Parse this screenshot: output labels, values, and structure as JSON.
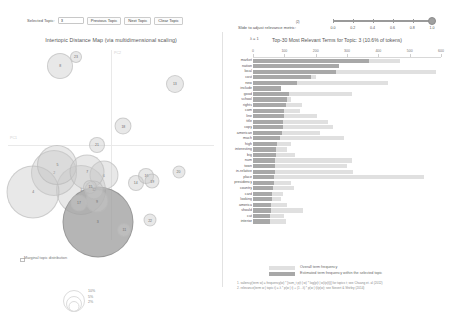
{
  "controls": {
    "selected_topic_label": "Selected Topic:",
    "selected_topic_value": "3",
    "previous_topic_label": "Previous Topic",
    "next_topic_label": "Next Topic",
    "clear_topic_label": "Clear Topic",
    "slider_label": "Slide to adjust relevance metric:",
    "slider_superscript": "(2)",
    "lambda_equation": "λ = 1",
    "slider_value": 1.0,
    "slider_ticks": [
      "0.0",
      "0.2",
      "0.4",
      "0.6",
      "0.8",
      "1.0"
    ]
  },
  "left_panel": {
    "title": "Intertopic Distance Map (via multidimensional scaling)",
    "axis_x_label": "PC2",
    "axis_y_label": "PC1",
    "marginal_label": "Marginal topic distribution",
    "size_keys": [
      "2%",
      "5%",
      "10%"
    ]
  },
  "right_panel": {
    "title": "Top-30 Most Relevant Terms for Topic: 3 (10.6% of tokens)",
    "axis_ticks": [
      "0",
      "100",
      "200",
      "300",
      "400",
      "500",
      "600"
    ],
    "axis_max": 600,
    "legend": {
      "overall_label": "Overall term frequency",
      "selected_label": "Estimated term frequency within the selected topic"
    },
    "footnotes": [
      "1. saliency(term w) = frequency(w) * [sum_t p(t | w) * log(p(t | w)/p(t))] for topics t; see Chuang et. al (2012)",
      "2. relevance(term w | topic t) = λ * p(w | t) + (1 - λ) * p(w | t)/p(w); see Sievert & Shirley (2014)"
    ]
  },
  "chart_data": {
    "type": "bar",
    "title": "Top-30 Most Relevant Terms for Topic: 3 (10.6% of tokens)",
    "xlabel": "",
    "ylabel": "",
    "xlim": [
      0,
      600
    ],
    "grid": false,
    "legend_position": "bottom",
    "orientation": "horizontal",
    "categories": [
      "market",
      "nation",
      "local",
      "cost",
      "new",
      "include",
      "good",
      "school",
      "rights",
      "com",
      "line",
      "title",
      "copy",
      "american",
      "much",
      "high",
      "interesting",
      "big",
      "num",
      "town",
      "in-relative",
      "place",
      "presidency",
      "country",
      "card",
      "looking",
      "america",
      "should",
      "cut",
      "interior"
    ],
    "series": [
      {
        "name": "Overall term frequency",
        "values": [
          470,
          235,
          585,
          200,
          430,
          90,
          315,
          120,
          155,
          150,
          205,
          240,
          255,
          215,
          290,
          120,
          108,
          135,
          315,
          300,
          320,
          545,
          120,
          130,
          95,
          90,
          110,
          160,
          100,
          105
        ]
      },
      {
        "name": "Estimated term frequency within the selected topic",
        "values": [
          370,
          275,
          265,
          185,
          140,
          88,
          115,
          110,
          105,
          100,
          98,
          96,
          95,
          92,
          86,
          78,
          74,
          72,
          71,
          70,
          69,
          68,
          66,
          64,
          62,
          60,
          58,
          57,
          55,
          53
        ]
      }
    ]
  },
  "topics": [
    {
      "id": 1,
      "x": 0.355,
      "y": 0.735,
      "size": 50,
      "selected": false
    },
    {
      "id": 2,
      "x": 0.225,
      "y": 0.648,
      "size": 46,
      "selected": false
    },
    {
      "id": 3,
      "x": 0.435,
      "y": 0.905,
      "size": 71,
      "selected": true
    },
    {
      "id": 4,
      "x": 0.122,
      "y": 0.745,
      "size": 53,
      "selected": false
    },
    {
      "id": 5,
      "x": 0.24,
      "y": 0.605,
      "size": 40,
      "selected": false
    },
    {
      "id": 6,
      "x": 0.465,
      "y": 0.66,
      "size": 29,
      "selected": false
    },
    {
      "id": 7,
      "x": 0.385,
      "y": 0.64,
      "size": 35,
      "selected": false
    },
    {
      "id": 8,
      "x": 0.253,
      "y": 0.085,
      "size": 26,
      "selected": false
    },
    {
      "id": 9,
      "x": 0.432,
      "y": 0.795,
      "size": 23,
      "selected": false
    },
    {
      "id": 11,
      "x": 0.565,
      "y": 0.945,
      "size": 14,
      "selected": false
    },
    {
      "id": 12,
      "x": 0.418,
      "y": 0.735,
      "size": 19,
      "selected": false
    },
    {
      "id": 13,
      "x": 0.81,
      "y": 0.18,
      "size": 18,
      "selected": false
    },
    {
      "id": 14,
      "x": 0.62,
      "y": 0.7,
      "size": 16,
      "selected": false
    },
    {
      "id": 15,
      "x": 0.4,
      "y": 0.72,
      "size": 14,
      "selected": false
    },
    {
      "id": 16,
      "x": 0.672,
      "y": 0.665,
      "size": 16,
      "selected": false
    },
    {
      "id": 17,
      "x": 0.345,
      "y": 0.805,
      "size": 17,
      "selected": false
    },
    {
      "id": 18,
      "x": 0.56,
      "y": 0.4,
      "size": 17,
      "selected": false
    },
    {
      "id": 19,
      "x": 0.7,
      "y": 0.69,
      "size": 15,
      "selected": false
    },
    {
      "id": 20,
      "x": 0.828,
      "y": 0.64,
      "size": 13,
      "selected": false
    },
    {
      "id": 21,
      "x": 0.432,
      "y": 0.5,
      "size": 16,
      "selected": false
    },
    {
      "id": 22,
      "x": 0.69,
      "y": 0.895,
      "size": 13,
      "selected": false
    },
    {
      "id": 23,
      "x": 0.33,
      "y": 0.035,
      "size": 12,
      "selected": false
    }
  ]
}
